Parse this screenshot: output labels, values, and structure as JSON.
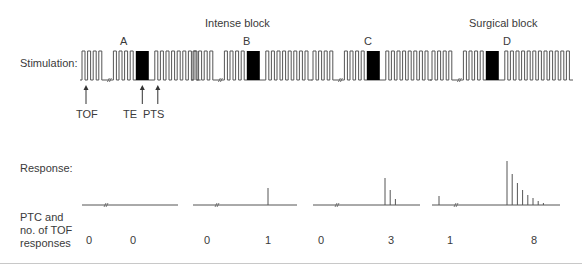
{
  "labels": {
    "stimulation": "Stimulation:",
    "response": "Response:",
    "ptc_line1": "PTC and",
    "ptc_line2": "no. of TOF",
    "ptc_line3": "responses"
  },
  "headers": {
    "intense_block": "Intense block",
    "surgical_block": "Surgical block"
  },
  "arrows": {
    "tof": "TOF",
    "te": "TE",
    "pts": "PTS"
  },
  "colors": {
    "line": "#555555",
    "fill": "#000000",
    "text": "#3a3a3a"
  },
  "blocks": [
    {
      "id": "A",
      "letter": "A",
      "ptc": "0",
      "tof_responses": "0",
      "tof_pulses": 4,
      "pts_pulses": 8,
      "response_ptc_heights": [],
      "response_tof_heights": []
    },
    {
      "id": "B",
      "letter": "B",
      "ptc": "0",
      "tof_responses": "1",
      "tof_pulses": 4,
      "pts_pulses": 8,
      "response_ptc_heights": [],
      "response_tof_heights": [
        17
      ]
    },
    {
      "id": "C",
      "letter": "C",
      "ptc": "0",
      "tof_responses": "3",
      "tof_pulses": 4,
      "pts_pulses": 8,
      "response_ptc_heights": [],
      "response_tof_heights": [
        27,
        15,
        6
      ]
    },
    {
      "id": "D",
      "letter": "D",
      "ptc": "1",
      "tof_responses": "8",
      "tof_pulses": 4,
      "pts_pulses": 12,
      "response_ptc_heights": [
        9
      ],
      "response_tof_heights": [
        44,
        31,
        22,
        15,
        10,
        7,
        4,
        2
      ]
    }
  ]
}
